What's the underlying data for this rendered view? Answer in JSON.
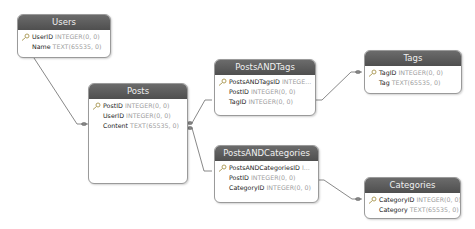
{
  "diagram": {
    "tables": [
      {
        "id": "users",
        "name": "Users",
        "fields": [
          {
            "name": "UserID",
            "type": "INTEGER(0, 0)",
            "primary_key": true
          },
          {
            "name": "Name",
            "type": "TEXT(65535, 0)",
            "primary_key": false
          }
        ]
      },
      {
        "id": "posts",
        "name": "Posts",
        "fields": [
          {
            "name": "PostID",
            "type": "INTEGER(0, 0)",
            "primary_key": true
          },
          {
            "name": "UserID",
            "type": "INTEGER(0, 0)",
            "primary_key": false
          },
          {
            "name": "Content",
            "type": "TEXT(65535, 0)",
            "primary_key": false
          }
        ]
      },
      {
        "id": "postsandtags",
        "name": "PostsANDTags",
        "fields": [
          {
            "name": "PostsANDTagsID",
            "type": "INTEGE...",
            "primary_key": true
          },
          {
            "name": "PostID",
            "type": "INTEGER(0, 0)",
            "primary_key": false
          },
          {
            "name": "TagID",
            "type": "INTEGER(0, 0)",
            "primary_key": false
          }
        ]
      },
      {
        "id": "tags",
        "name": "Tags",
        "fields": [
          {
            "name": "TagID",
            "type": "INTEGER(0, 0)",
            "primary_key": true
          },
          {
            "name": "Tag",
            "type": "TEXT(65535, 0)",
            "primary_key": false
          }
        ]
      },
      {
        "id": "postsandcategories",
        "name": "PostsANDCategories",
        "fields": [
          {
            "name": "PostsANDCategoriesID",
            "type": "I...",
            "primary_key": true
          },
          {
            "name": "PostID",
            "type": "INTEGER(0, 0)",
            "primary_key": false
          },
          {
            "name": "CategoryID",
            "type": "INTEGER(0, 0)",
            "primary_key": false
          }
        ]
      },
      {
        "id": "categories",
        "name": "Categories",
        "fields": [
          {
            "name": "CategoryID",
            "type": "INTEGER(0, 0)",
            "primary_key": true
          },
          {
            "name": "Category",
            "type": "TEXT(65535, 0)",
            "primary_key": false
          }
        ]
      }
    ],
    "relationships": [
      {
        "from": "Users",
        "to": "Posts"
      },
      {
        "from": "Posts",
        "to": "PostsANDTags"
      },
      {
        "from": "PostsANDTags",
        "to": "Tags"
      },
      {
        "from": "Posts",
        "to": "PostsANDCategories"
      },
      {
        "from": "PostsANDCategories",
        "to": "Categories"
      }
    ],
    "colors": {
      "header": "#5a5a5a",
      "header_text": "#f0f0f0",
      "field_name": "#222222",
      "field_type": "#a0a0a0",
      "border": "#9a9a9a",
      "line": "#666666"
    }
  }
}
